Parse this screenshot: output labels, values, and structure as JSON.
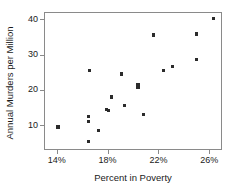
{
  "chart_data": {
    "type": "scatter",
    "title": "",
    "xlabel": "Percent in Poverty",
    "ylabel": "Annual Murders per Million",
    "xlim": [
      13.0,
      27.0
    ],
    "ylim": [
      3.0,
      42.0
    ],
    "xticks": [
      14,
      18,
      22,
      26
    ],
    "xtick_labels": [
      "14%",
      "18%",
      "22%",
      "26%"
    ],
    "yticks": [
      10,
      20,
      30,
      40
    ],
    "ytick_labels": [
      "10",
      "20",
      "30",
      "40"
    ],
    "grid": false,
    "legend": null,
    "marker": "square",
    "marker_color": "#2b2b2b",
    "points": [
      {
        "x": 14.1,
        "y": 9.5
      },
      {
        "x": 16.5,
        "y": 12.4
      },
      {
        "x": 16.5,
        "y": 11.0
      },
      {
        "x": 16.5,
        "y": 5.3
      },
      {
        "x": 16.6,
        "y": 25.5
      },
      {
        "x": 17.3,
        "y": 8.6
      },
      {
        "x": 17.9,
        "y": 14.5
      },
      {
        "x": 18.1,
        "y": 14.2
      },
      {
        "x": 18.3,
        "y": 18.0
      },
      {
        "x": 19.1,
        "y": 24.5
      },
      {
        "x": 19.3,
        "y": 15.5
      },
      {
        "x": 20.4,
        "y": 21.5
      },
      {
        "x": 20.4,
        "y": 20.8
      },
      {
        "x": 20.8,
        "y": 13.1
      },
      {
        "x": 21.6,
        "y": 35.5
      },
      {
        "x": 22.4,
        "y": 25.4
      },
      {
        "x": 23.1,
        "y": 26.5
      },
      {
        "x": 25.0,
        "y": 35.8
      },
      {
        "x": 25.0,
        "y": 28.5
      },
      {
        "x": 26.3,
        "y": 40.2
      }
    ]
  },
  "axes": {
    "x_title": "Percent in Poverty",
    "y_title": "Annual Murders per Million"
  }
}
